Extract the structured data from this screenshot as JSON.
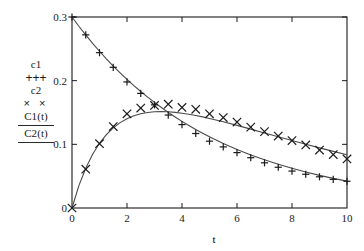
{
  "chart_data": {
    "type": "scatter",
    "title": "",
    "subtitle": "",
    "xlabel": "t",
    "ylabel": "",
    "xlim": [
      0,
      10
    ],
    "ylim": [
      0,
      0.3
    ],
    "xticks": [
      0,
      2,
      4,
      6,
      8,
      10
    ],
    "xtick_labels": [
      "0",
      "2",
      "4",
      "6",
      "8",
      "10"
    ],
    "yticks": [
      0,
      0.1,
      0.2,
      0.3
    ],
    "ytick_labels": [
      "0",
      "0.1",
      "0.2",
      "0.3"
    ],
    "grid": false,
    "legend_position": "outside-left",
    "series": [
      {
        "name": "c1",
        "type": "scatter",
        "marker": "plus",
        "color": "#1a1a1a",
        "x": [
          0,
          0.5,
          1,
          1.5,
          2,
          2.5,
          3,
          3.5,
          4,
          4.5,
          5,
          5.5,
          6,
          6.5,
          7,
          7.5,
          8,
          8.5,
          9,
          9.5,
          10
        ],
        "y": [
          0.3,
          0.272,
          0.244,
          0.221,
          0.198,
          0.18,
          0.162,
          0.146,
          0.131,
          0.117,
          0.105,
          0.096,
          0.087,
          0.079,
          0.071,
          0.064,
          0.058,
          0.053,
          0.049,
          0.045,
          0.042
        ]
      },
      {
        "name": "c2",
        "type": "scatter",
        "marker": "cross",
        "color": "#1a1a1a",
        "x": [
          0,
          0.5,
          1,
          1.5,
          2,
          2.5,
          3,
          3.5,
          4,
          4.5,
          5,
          5.5,
          6,
          6.5,
          7,
          7.5,
          8,
          8.5,
          9,
          9.5,
          10
        ],
        "y": [
          0.0,
          0.061,
          0.101,
          0.128,
          0.148,
          0.157,
          0.161,
          0.163,
          0.158,
          0.155,
          0.148,
          0.142,
          0.135,
          0.127,
          0.12,
          0.113,
          0.106,
          0.099,
          0.091,
          0.084,
          0.077
        ]
      },
      {
        "name": "C1(t)",
        "type": "line",
        "color": "#4a4a4a",
        "x": [
          0,
          0.25,
          0.5,
          0.75,
          1,
          1.25,
          1.5,
          1.75,
          2,
          2.25,
          2.5,
          2.75,
          3,
          3.25,
          3.5,
          3.75,
          4,
          4.25,
          4.5,
          4.75,
          5,
          5.5,
          6,
          6.5,
          7,
          7.5,
          8,
          8.5,
          9,
          9.5,
          10
        ],
        "y": [
          0.3,
          0.2855,
          0.2718,
          0.2587,
          0.2462,
          0.2343,
          0.223,
          0.2123,
          0.202,
          0.1923,
          0.183,
          0.1742,
          0.1658,
          0.1578,
          0.1502,
          0.143,
          0.1361,
          0.1296,
          0.1234,
          0.1175,
          0.1119,
          0.1014,
          0.092,
          0.0834,
          0.0757,
          0.0686,
          0.0623,
          0.0565,
          0.0512,
          0.0465,
          0.0422
        ]
      },
      {
        "name": "C2(t)",
        "type": "line",
        "color": "#4a4a4a",
        "x": [
          0,
          0.25,
          0.5,
          0.75,
          1,
          1.25,
          1.5,
          1.75,
          2,
          2.25,
          2.5,
          2.75,
          3,
          3.25,
          3.5,
          3.75,
          4,
          4.25,
          4.5,
          4.75,
          5,
          5.5,
          6,
          6.5,
          7,
          7.5,
          8,
          8.5,
          9,
          9.5,
          10
        ],
        "y": [
          0.0,
          0.0352,
          0.0625,
          0.0843,
          0.1016,
          0.1152,
          0.1259,
          0.1341,
          0.1403,
          0.1448,
          0.148,
          0.15,
          0.1511,
          0.1514,
          0.1511,
          0.1502,
          0.1489,
          0.1473,
          0.1453,
          0.1431,
          0.1407,
          0.1355,
          0.1298,
          0.1239,
          0.1179,
          0.1119,
          0.1059,
          0.1001,
          0.0944,
          0.0889,
          0.0836
        ]
      }
    ]
  },
  "legend": {
    "entries": [
      {
        "label": "c1",
        "marker": "+++",
        "kind": "marker"
      },
      {
        "label": "c2",
        "marker": "× ×",
        "kind": "marker"
      },
      {
        "label": "C1(t)",
        "marker": "",
        "kind": "line"
      },
      {
        "label": "C2(t)",
        "marker": "",
        "kind": "line"
      }
    ]
  },
  "axes": {
    "x_axis_label": "t"
  },
  "colors": {
    "background": "#ffffff",
    "axis": "#1a1a1a",
    "marker": "#1a1a1a",
    "curve": "#4a4a4a"
  }
}
